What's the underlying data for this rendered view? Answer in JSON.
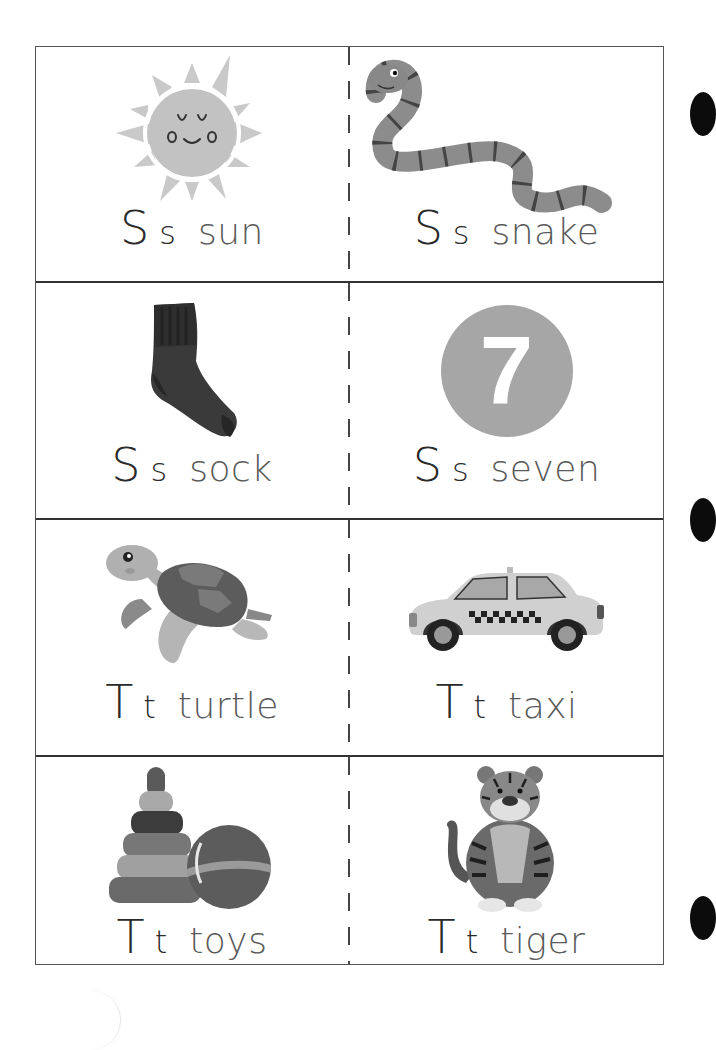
{
  "sheet": {
    "title": "Letter Ss and Tt picture cards",
    "colors": {
      "border": "#555555",
      "row_rule": "#333333",
      "cap_letter": "#2a2a2a",
      "word": "#5a5a5a",
      "sun": "#c8c8c8",
      "seven_circle": "#a6a6a6"
    }
  },
  "cards": [
    {
      "row": 1,
      "col": "left",
      "upper": "S",
      "lower": "s",
      "word": "sun",
      "icon": "sun-icon"
    },
    {
      "row": 1,
      "col": "right",
      "upper": "S",
      "lower": "s",
      "word": "snake",
      "icon": "snake-icon"
    },
    {
      "row": 2,
      "col": "left",
      "upper": "S",
      "lower": "s",
      "word": "sock",
      "icon": "sock-icon"
    },
    {
      "row": 2,
      "col": "right",
      "upper": "S",
      "lower": "s",
      "word": "seven",
      "icon": "number-seven-icon",
      "number": "7"
    },
    {
      "row": 3,
      "col": "left",
      "upper": "T",
      "lower": "t",
      "word": "turtle",
      "icon": "turtle-icon"
    },
    {
      "row": 3,
      "col": "right",
      "upper": "T",
      "lower": "t",
      "word": "taxi",
      "icon": "taxi-icon"
    },
    {
      "row": 4,
      "col": "left",
      "upper": "T",
      "lower": "t",
      "word": "toys",
      "icon": "toys-icon"
    },
    {
      "row": 4,
      "col": "right",
      "upper": "T",
      "lower": "t",
      "word": "tiger",
      "icon": "tiger-icon"
    }
  ]
}
